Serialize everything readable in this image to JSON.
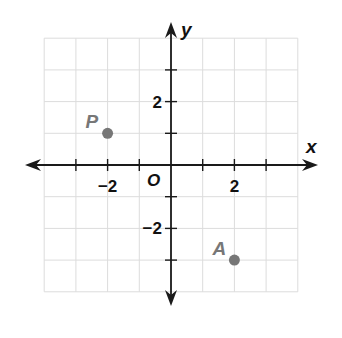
{
  "chart_data": {
    "type": "scatter",
    "title": "",
    "xlabel": "x",
    "ylabel": "y",
    "origin_label": "O",
    "xlim": [
      -4,
      4
    ],
    "ylim": [
      -4,
      4
    ],
    "grid": true,
    "grid_step": 1,
    "x_ticks": [
      -3,
      -2,
      -1,
      1,
      2,
      3
    ],
    "y_ticks": [
      -3,
      -2,
      -1,
      1,
      2,
      3
    ],
    "x_tick_labels": [
      {
        "value": -2,
        "label": "−2"
      },
      {
        "value": 2,
        "label": "2"
      }
    ],
    "y_tick_labels": [
      {
        "value": 2,
        "label": "2"
      },
      {
        "value": -2,
        "label": "−2"
      }
    ],
    "points": [
      {
        "name": "P",
        "x": -2,
        "y": 1,
        "color": "#777777"
      },
      {
        "name": "A",
        "x": 2,
        "y": -3,
        "color": "#777777"
      }
    ],
    "axis_color": "#1a1a1a",
    "grid_color": "#dcdcdc"
  }
}
